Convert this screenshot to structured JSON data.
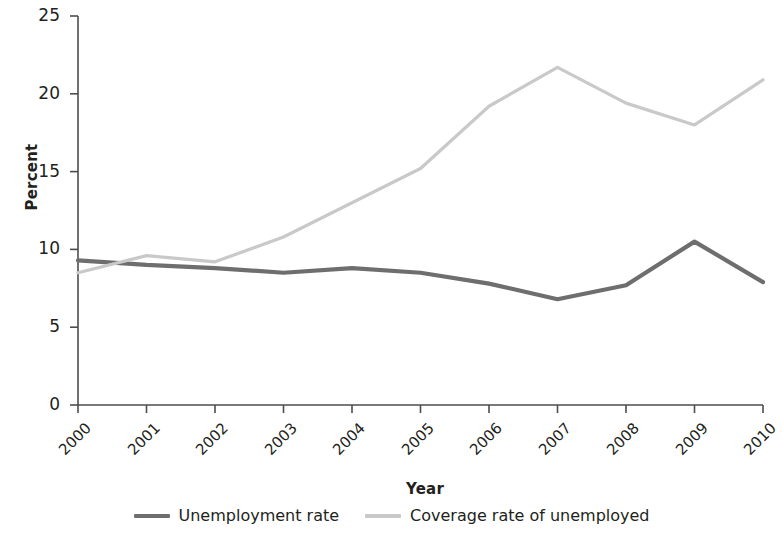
{
  "chart_data": {
    "type": "line",
    "title": "",
    "subtitle": "",
    "xlabel": "Year",
    "ylabel": "Percent",
    "categories": [
      "2000",
      "2001",
      "2002",
      "2003",
      "2004",
      "2005",
      "2006",
      "2007",
      "2008",
      "2009",
      "2010"
    ],
    "x": [
      2000,
      2001,
      2002,
      2003,
      2004,
      2005,
      2006,
      2007,
      2008,
      2009,
      2010
    ],
    "xlim": [
      2000,
      2010
    ],
    "ylim": [
      0,
      25
    ],
    "y_ticks": [
      0,
      5,
      10,
      15,
      20,
      25
    ],
    "x_ticks": [
      "2000",
      "2001",
      "2002",
      "2003",
      "2004",
      "2005",
      "2006",
      "2007",
      "2008",
      "2009",
      "2010"
    ],
    "grid": false,
    "legend_position": "bottom",
    "series": [
      {
        "name": "Unemployment rate",
        "color": "#6e6e6e",
        "values": [
          9.3,
          9.0,
          8.8,
          8.5,
          8.8,
          8.5,
          7.8,
          6.8,
          7.7,
          10.5,
          7.9
        ]
      },
      {
        "name": "Coverage rate of unemployed",
        "color": "#c9c9c9",
        "values": [
          8.5,
          9.6,
          9.2,
          10.8,
          13.0,
          15.2,
          19.2,
          21.7,
          19.4,
          18.0,
          20.9
        ]
      }
    ]
  },
  "legend": {
    "items": [
      {
        "label": "Unemployment rate",
        "swatch": "legend-swatch-unemployment-rate"
      },
      {
        "label": "Coverage rate of unemployed",
        "swatch": "legend-swatch-coverage-rate"
      }
    ]
  },
  "axis": {
    "y_title": "Percent",
    "x_title": "Year",
    "axis_color": "#4d4d4d"
  }
}
